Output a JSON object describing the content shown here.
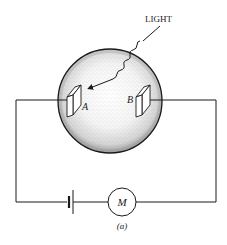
{
  "diagram": {
    "type": "photoelectric-effect-apparatus",
    "caption": "(a)",
    "labels": {
      "light": "LIGHT",
      "electrode_a": "A",
      "electrode_b": "B",
      "meter": "M"
    },
    "components": [
      {
        "id": "vacuum-tube",
        "shape": "circle",
        "fill": "stippled"
      },
      {
        "id": "electrode-a",
        "label": "A",
        "position": "left inside tube"
      },
      {
        "id": "electrode-b",
        "label": "B",
        "position": "right inside tube"
      },
      {
        "id": "light-ray",
        "label": "LIGHT",
        "style": "wavy arrow pointing to A"
      },
      {
        "id": "battery",
        "position": "bottom-left of circuit"
      },
      {
        "id": "meter",
        "label": "M",
        "position": "bottom-center of circuit"
      }
    ],
    "colors": {
      "ink": "#1a1a1a",
      "background": "#ffffff",
      "stipple": "#8a8a8a"
    }
  }
}
